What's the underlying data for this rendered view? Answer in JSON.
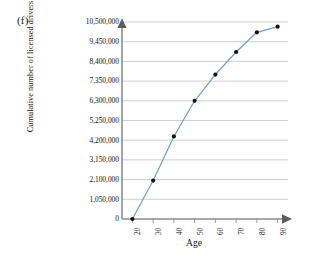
{
  "figure": {
    "panel_label": "(f)",
    "xlabel": "Age",
    "ylabel": "Cumulative number of licensed drivers"
  },
  "style": {
    "line_color": "#6fa0c4",
    "marker_color": "#121212",
    "grid_color": "#b9b9b9",
    "axis_color": "#8d8d8d",
    "background": "#ffffff"
  },
  "chart_data": {
    "type": "line",
    "title": "(f)",
    "xlabel": "Age",
    "ylabel": "Cumulative number of licensed drivers",
    "x": [
      20,
      30,
      40,
      50,
      60,
      70,
      80,
      90
    ],
    "values": [
      0,
      2050000,
      4400000,
      6300000,
      7700000,
      8900000,
      9950000,
      10250000
    ],
    "xtick_labels": [
      "20",
      "30",
      "40",
      "50",
      "60",
      "70",
      "80",
      "90"
    ],
    "ytick_labels": [
      "0",
      "1,050,000",
      "2,100,000",
      "3,150,000",
      "4,200,000",
      "5,250,000",
      "6,300,000",
      "7,350,000",
      "8,400,000",
      "9,450,000",
      "10,500,000"
    ],
    "ytick_values": [
      0,
      1050000,
      2100000,
      3150000,
      4200000,
      5250000,
      6300000,
      7350000,
      8400000,
      9450000,
      10500000
    ],
    "xlim": [
      15,
      95
    ],
    "ylim": [
      0,
      10500000
    ],
    "grid": "horizontal",
    "legend": "none",
    "markers": "filled-circle"
  }
}
